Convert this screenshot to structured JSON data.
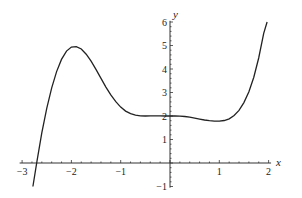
{
  "chart_data": {
    "type": "line",
    "title": "",
    "xlabel": "x",
    "ylabel": "y",
    "xlim": [
      -3,
      2
    ],
    "ylim": [
      -1,
      6
    ],
    "grid": false,
    "legend": null,
    "x_ticks": [
      -3,
      -2,
      -1,
      1,
      2
    ],
    "x_tick_labels": [
      "−3",
      "−2",
      "−1",
      "1",
      "2"
    ],
    "y_ticks": [
      -1,
      1,
      2,
      3,
      4,
      5,
      6
    ],
    "y_tick_labels": [
      "−1",
      "1",
      "2",
      "3",
      "4",
      "5",
      "6"
    ],
    "series": [
      {
        "name": "f(x)",
        "color": "#222222",
        "x": [
          -2.78,
          -2.7,
          -2.6,
          -2.5,
          -2.4,
          -2.3,
          -2.2,
          -2.1,
          -2.0,
          -1.9,
          -1.8,
          -1.7,
          -1.6,
          -1.5,
          -1.4,
          -1.3,
          -1.2,
          -1.1,
          -1.0,
          -0.9,
          -0.8,
          -0.7,
          -0.6,
          -0.5,
          -0.4,
          -0.3,
          -0.2,
          -0.1,
          0.0,
          0.1,
          0.2,
          0.3,
          0.4,
          0.5,
          0.6,
          0.7,
          0.8,
          0.9,
          1.0,
          1.1,
          1.2,
          1.3,
          1.4,
          1.5,
          1.6,
          1.7,
          1.8,
          1.9,
          1.97
        ],
        "y": [
          -1.0,
          0.06,
          1.28,
          2.33,
          3.2,
          3.89,
          4.41,
          4.76,
          4.93,
          4.95,
          4.85,
          4.63,
          4.33,
          3.97,
          3.6,
          3.23,
          2.9,
          2.61,
          2.38,
          2.21,
          2.1,
          2.04,
          2.01,
          2.0,
          2.01,
          2.01,
          2.01,
          2.0,
          2.0,
          2.0,
          1.99,
          1.98,
          1.95,
          1.91,
          1.87,
          1.83,
          1.8,
          1.78,
          1.78,
          1.81,
          1.88,
          2.02,
          2.24,
          2.57,
          3.03,
          3.65,
          4.47,
          5.52,
          6.0
        ]
      }
    ]
  },
  "axes": {
    "x_label": "x",
    "y_label": "y"
  }
}
